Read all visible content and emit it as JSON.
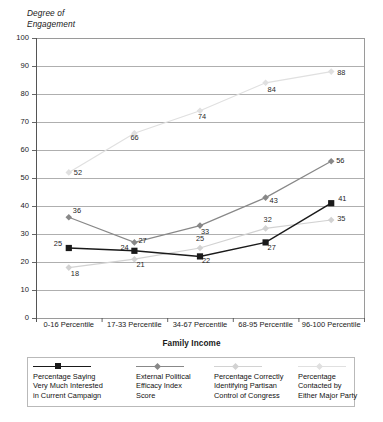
{
  "chart_data": {
    "type": "line",
    "title": "",
    "xlabel": "Family Income",
    "ylabel": "Degree of\nEngagement",
    "ylim": [
      0,
      100
    ],
    "ystep": 10,
    "grid": true,
    "legend_position": "bottom",
    "categories": [
      "0-16 Percentile",
      "17-33 Percentile",
      "34-67 Percentile",
      "68-95 Percentile",
      "96-100 Percentile"
    ],
    "yticks": [
      "0",
      "10",
      "20",
      "30",
      "40",
      "50",
      "60",
      "70",
      "80",
      "90",
      "100"
    ],
    "series": [
      {
        "name": "Percentage Saying Very Much Interested in Current Campaign",
        "color": "#1a1a1a",
        "marker": "square",
        "values": [
          25,
          24,
          22,
          27,
          41
        ],
        "labels": [
          "25",
          "24",
          "22",
          "27",
          "41"
        ]
      },
      {
        "name": "External Political Efficacy Index Score",
        "color": "#888888",
        "marker": "diamond",
        "values": [
          36,
          27,
          33,
          43,
          56
        ],
        "labels": [
          "36",
          "27",
          "33",
          "43",
          "56"
        ]
      },
      {
        "name": "Percentage Correctly Identifying Partisan Control of Congress",
        "color": "#d2d2d2",
        "marker": "diamond",
        "values": [
          18,
          21,
          25,
          32,
          35
        ],
        "labels": [
          "18",
          "21",
          "25",
          "32",
          "35"
        ]
      },
      {
        "name": "Percentage Contacted by Either Major Party",
        "color": "#e0e0e0",
        "marker": "diamond",
        "values": [
          52,
          66,
          74,
          84,
          88
        ],
        "labels": [
          "52",
          "66",
          "74",
          "84",
          "88"
        ]
      }
    ]
  },
  "legend": {
    "items": [
      {
        "label": "Percentage Saying\nVery Much Interested\nin Current Campaign",
        "color": "#1a1a1a",
        "marker": "square"
      },
      {
        "label": "External Political\nEfficacy Index\nScore",
        "color": "#888888",
        "marker": "diamond"
      },
      {
        "label": "Percentage Correctly\nIdentifying Partisan\nControl of Congress",
        "color": "#d2d2d2",
        "marker": "diamond"
      },
      {
        "label": "Percentage\nContacted by\nEither Major Party",
        "color": "#e0e0e0",
        "marker": "diamond"
      }
    ]
  }
}
